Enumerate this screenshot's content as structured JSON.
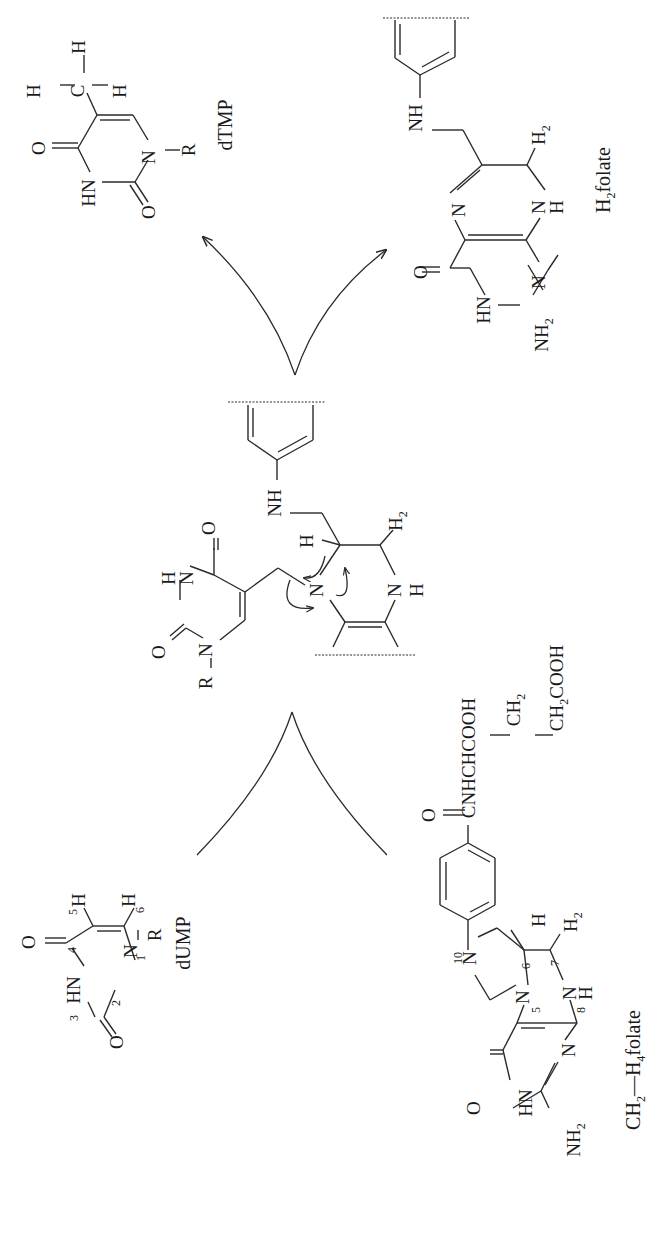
{
  "figure": {
    "orientation": "rotated 90 degrees counterclockwise"
  },
  "reactants": {
    "dump": {
      "label": "dUMP",
      "atoms": [
        "O",
        "HN",
        "N",
        "O",
        "H",
        "H",
        "R"
      ],
      "ring_numbers": [
        "1",
        "2",
        "3",
        "4",
        "5",
        "6"
      ]
    },
    "methylene_thf": {
      "label_prefix": "CH",
      "label_sub1": "2",
      "label_mid": "—H",
      "label_sub2": "4",
      "label_suffix": "folate",
      "atoms": [
        "O",
        "HN",
        "N",
        "N",
        "N",
        "N",
        "NH",
        "H",
        "H",
        "O",
        "C",
        "NHCHCOOH",
        "CH",
        "CH",
        "COOH"
      ],
      "ring_numbers": [
        "5",
        "6",
        "7",
        "8",
        "10"
      ],
      "side_chain": {
        "amide": "CNHCHCOOH",
        "ch2_1": "CH",
        "ch2_1_sub": "2",
        "ch2cooh": "CH",
        "ch2cooh_sub": "2",
        "ch2cooh_tail": "COOH"
      },
      "amino": "NH",
      "amino_sub": "2",
      "h2": "H",
      "h2_sub": "2"
    }
  },
  "intermediate": {
    "atoms": {
      "o_top": "O",
      "hn": "H",
      "n_h": "N",
      "o_left": "O",
      "n1": "N",
      "r": "R",
      "n5": "N",
      "h6": "H",
      "nh_top": "NH",
      "h2": "H",
      "h2_sub": "2",
      "n8": "N",
      "h8": "H"
    }
  },
  "products": {
    "dtmp": {
      "label": "dTMP",
      "methyl": {
        "c": "C",
        "h": "H"
      },
      "atoms": {
        "o": "O",
        "hn": "HN",
        "n": "N",
        "o2": "O",
        "r": "R"
      }
    },
    "dihydrofolate": {
      "label_prefix": "H",
      "label_sub": "2",
      "label_suffix": "folate",
      "atoms": {
        "o": "O",
        "hn": "HN",
        "n_a": "N",
        "n_b": "N",
        "n_c": "N",
        "h": "H",
        "nh": "NH",
        "h2": "H",
        "h2_sub": "2",
        "amino": "NH",
        "amino_sub": "2"
      }
    }
  },
  "arrows": {
    "reactant_merge": "converging curves from dUMP and CH2-H4folate",
    "product_split": "diverging arrows to dTMP and H2folate",
    "electron_pushing": "curved arrows on N5 / C6-H of intermediate"
  },
  "colors": {
    "ink": "#1a1a1a",
    "background": "#ffffff"
  }
}
